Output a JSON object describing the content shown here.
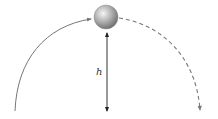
{
  "diagram": {
    "type": "projectile-motion",
    "labels": {
      "height": "h"
    },
    "elements": {
      "ball": {
        "cx": 106,
        "cy": 17,
        "r": 12,
        "color": "#8a8a8a"
      },
      "rising_path": {
        "style": "solid",
        "color": "#777777"
      },
      "falling_path": {
        "style": "dashed",
        "color": "#777777"
      },
      "height_arrow": {
        "style": "double-headed",
        "color": "#333333"
      }
    }
  }
}
